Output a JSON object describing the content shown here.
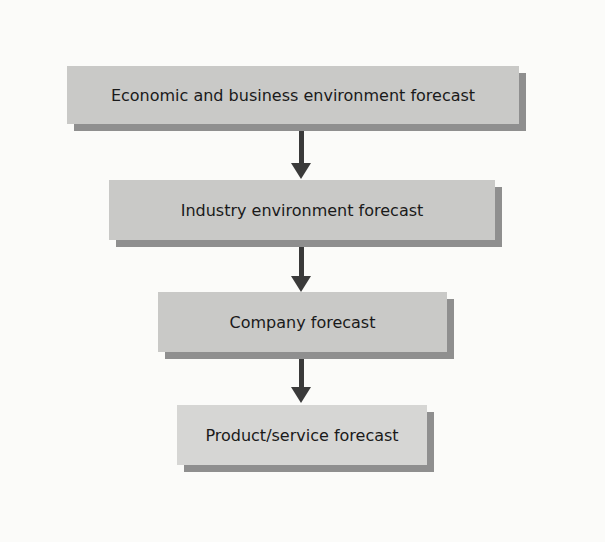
{
  "diagram": {
    "type": "flowchart",
    "direction": "top-to-bottom",
    "nodes": [
      {
        "id": "n1",
        "label": "Economic and business environment forecast"
      },
      {
        "id": "n2",
        "label": "Industry environment forecast"
      },
      {
        "id": "n3",
        "label": "Company forecast"
      },
      {
        "id": "n4",
        "label": "Product/service forecast"
      }
    ],
    "edges": [
      {
        "from": "n1",
        "to": "n2"
      },
      {
        "from": "n2",
        "to": "n3"
      },
      {
        "from": "n3",
        "to": "n4"
      }
    ],
    "colors": {
      "box_fill": "#c9c9c7",
      "box_fill_last": "#d6d6d4",
      "shadow": "#8f8f8f",
      "arrow": "#3a3a3a",
      "background": "#fbfbf9"
    }
  }
}
